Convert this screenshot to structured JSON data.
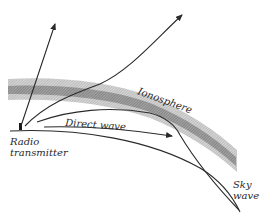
{
  "diagram": {
    "labels": {
      "ionosphere": "Ionosphere",
      "direct_wave": "Direct wave",
      "transmitter_line1": "Radio",
      "transmitter_line2": "transmitter",
      "sky_wave_line1": "Sky",
      "sky_wave_line2": "wave"
    },
    "colors": {
      "background": "#ffffff",
      "line": "#2a2a2a",
      "ionosphere_outer": "#c4c4c4",
      "ionosphere_inner": "#8a8a8a"
    }
  }
}
